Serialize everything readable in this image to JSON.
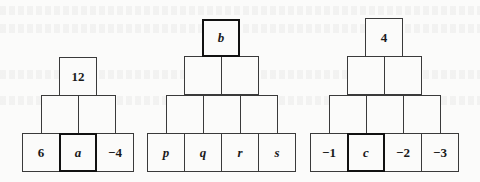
{
  "pyramids": [
    {
      "id": "left",
      "rows": [
        [
          "12"
        ],
        [
          "",
          ""
        ],
        [
          "6",
          "a",
          "−4"
        ]
      ],
      "highlighted": "a"
    },
    {
      "id": "middle",
      "rows": [
        [
          "b"
        ],
        [
          "",
          ""
        ],
        [
          "",
          "",
          ""
        ],
        [
          "p",
          "q",
          "r",
          "s"
        ]
      ],
      "highlighted": "b"
    },
    {
      "id": "right",
      "rows": [
        [
          "4"
        ],
        [
          "",
          ""
        ],
        [
          "",
          "",
          ""
        ],
        [
          "−1",
          "c",
          "−2",
          "−3"
        ]
      ],
      "highlighted": "c"
    }
  ]
}
